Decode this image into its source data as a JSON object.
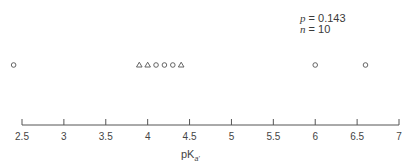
{
  "chart_data": {
    "type": "scatter",
    "title": "",
    "xlabel": "pKa'",
    "ylabel": "",
    "xlim": [
      2.5,
      7
    ],
    "xticks": [
      2.5,
      3,
      3.5,
      4,
      4.5,
      5,
      5.5,
      6,
      6.5,
      7
    ],
    "xtick_labels": [
      "2.5",
      "3",
      "3.5",
      "4",
      "4.5",
      "5",
      "5.5",
      "6",
      "6.5",
      "7"
    ],
    "grid": false,
    "legend": null,
    "annotations": [
      {
        "text": "p = 0.143",
        "position": "top-right"
      },
      {
        "text": "n = 10",
        "position": "top-right"
      }
    ],
    "series": [
      {
        "name": "circles",
        "marker": "circle",
        "x": [
          2.4,
          4.1,
          4.2,
          4.3,
          6.0,
          6.6
        ]
      },
      {
        "name": "triangles",
        "marker": "triangle",
        "x": [
          3.9,
          4.0,
          4.4
        ]
      }
    ]
  },
  "annotation": {
    "p_label": "p",
    "p_value": "= 0.143",
    "n_label": "n",
    "n_value": "= 10"
  },
  "axis": {
    "label_main": "pK",
    "label_sub": "a'"
  }
}
